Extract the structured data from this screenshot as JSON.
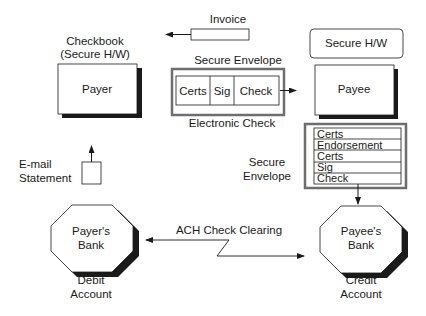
{
  "invoice": {
    "label": "Invoice"
  },
  "payer": {
    "caption_line1": "Checkbook",
    "caption_line2": "(Secure H/W)",
    "label": "Payer"
  },
  "payee": {
    "secure_hw_label": "Secure H/W",
    "label": "Payee"
  },
  "electronic_check": {
    "envelope_label": "Secure Envelope",
    "caption": "Electronic Check",
    "fields": [
      "Certs",
      "Sig",
      "Check"
    ]
  },
  "endorsed_envelope": {
    "label_line1": "Secure",
    "label_line2": "Envelope",
    "rows": [
      "Certs",
      "Endorsement",
      "Certs",
      "Sig",
      "Check"
    ]
  },
  "statement": {
    "label_line1": "E-mail",
    "label_line2": "Statement"
  },
  "payer_bank": {
    "label_line1": "Payer's",
    "label_line2": "Bank",
    "caption_line1": "Debit",
    "caption_line2": "Account"
  },
  "payee_bank": {
    "label_line1": "Payee's",
    "label_line2": "Bank",
    "caption_line1": "Credit",
    "caption_line2": "Account"
  },
  "clearing": {
    "label": "ACH Check Clearing"
  },
  "colors": {
    "line": "#1a1a1a",
    "shadow": "#1a1a1a",
    "envelope_border": "#6e6e6e",
    "background": "#ffffff"
  }
}
